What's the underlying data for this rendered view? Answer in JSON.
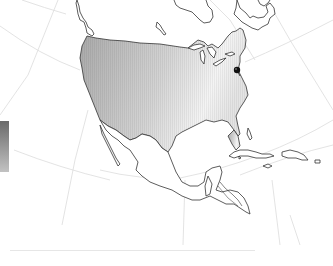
{
  "map": {
    "region": "North America",
    "projection": "conic (curved graticule)",
    "shaded_region": "United States",
    "gradient": {
      "west_color": "#a9a9a9",
      "east_color": "#f2f2f2"
    },
    "outline_color": "#333333",
    "graticule_color": "#d9d9d9",
    "marker": {
      "label": "location-marker",
      "color": "#111111",
      "x": 237,
      "y": 70
    }
  },
  "legend": {
    "type": "color gradient bar",
    "top_color": "#6e6e6e",
    "bottom_color": "#bdbdbd"
  },
  "footer": {
    "caption": ""
  }
}
